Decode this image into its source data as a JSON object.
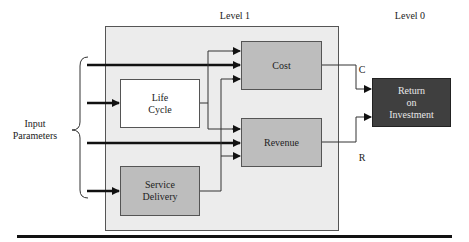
{
  "labels": {
    "level1": "Level 1",
    "level0": "Level 0",
    "inputs": "Input\nParameters",
    "c": "C",
    "r": "R"
  },
  "boxes": {
    "cost": "Cost",
    "life_cycle": "Life\nCycle",
    "revenue": "Revenue",
    "service_delivery": "Service\nDelivery",
    "roi": "Return\non\nInvestment"
  },
  "colors": {
    "level1_bg": "#ececec",
    "module_gray": "#bdbdbd",
    "roi_dark": "#3f3f3f"
  }
}
